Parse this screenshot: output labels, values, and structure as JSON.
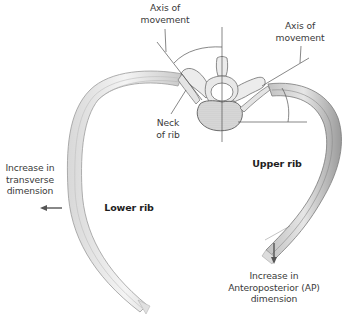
{
  "figure": {
    "labels": {
      "axis_left": [
        "Axis of",
        "movement"
      ],
      "axis_right": [
        "Axis of",
        "movement"
      ],
      "neck_of_rib": [
        "Neck",
        "of rib"
      ],
      "upper_rib": "Upper rib",
      "lower_rib": "Lower rib",
      "transverse": [
        "Increase in",
        "transverse",
        "dimension"
      ],
      "ap": [
        "Increase in",
        "Anteroposterior (AP)",
        "dimension"
      ]
    },
    "arrows": {
      "transverse": "left-arrow",
      "ap": "down-arrow"
    },
    "colors": {
      "bone_fill": "#eeeeee",
      "bone_stroke": "#6e6e6e",
      "bone_shadow": "#b8b8b8",
      "leader_line": "#555555",
      "arrow": "#555555",
      "text": "#3a3a3a"
    }
  }
}
